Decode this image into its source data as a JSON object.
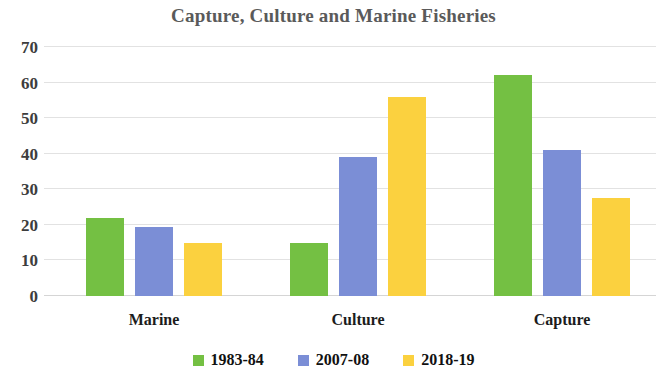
{
  "chart_data": {
    "type": "bar",
    "title": "Capture, Culture and Marine Fisheries",
    "xlabel": "",
    "ylabel": "",
    "categories": [
      "Marine",
      "Culture",
      "Capture"
    ],
    "series": [
      {
        "name": "1983-84",
        "color": "#74c043",
        "values": [
          22,
          15,
          62
        ]
      },
      {
        "name": "2007-08",
        "color": "#7b8ed6",
        "values": [
          19.3,
          39,
          41
        ]
      },
      {
        "name": "2018-19",
        "color": "#fbd13f",
        "values": [
          15,
          56,
          27.5
        ]
      }
    ],
    "ylim": [
      0,
      70
    ],
    "yticks": [
      0,
      10,
      20,
      30,
      40,
      50,
      60,
      70
    ],
    "ytick_labels": [
      "0",
      "10",
      "20",
      "30",
      "40",
      "50",
      "60",
      "70"
    ],
    "grid": true,
    "legend_position": "bottom"
  },
  "colors": {
    "title": "#5a5a5a",
    "axis_text": "#3d3d3d",
    "category_text": "#1c1c1c",
    "gridline": "#e2e2e2",
    "background": "#ffffff"
  }
}
